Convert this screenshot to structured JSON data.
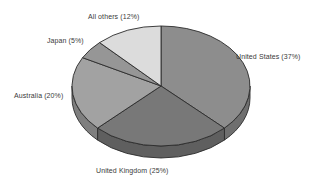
{
  "chart_data": {
    "type": "pie",
    "title": "",
    "subtitle": "",
    "xlabel": "",
    "ylabel": "",
    "legend_position": "none",
    "grid": false,
    "three_d": true,
    "start_angle_deg": 0,
    "direction": "clockwise",
    "categories": [
      "United States",
      "United Kingdom",
      "Australia",
      "Japan",
      "All others"
    ],
    "values": [
      37,
      25,
      20,
      5,
      12
    ],
    "unit": "%",
    "slices": [
      {
        "name": "United States",
        "value": 37,
        "label": "United States (37%)",
        "color": "#8d8d8d",
        "side_color": "#6f6f6f",
        "label_position": "right"
      },
      {
        "name": "United Kingdom",
        "value": 25,
        "label": "United Kingdom (25%)",
        "color": "#787878",
        "side_color": "#5f5f5f",
        "label_position": "bottom"
      },
      {
        "name": "Australia",
        "value": 20,
        "label": "Australia (20%)",
        "color": "#a2a2a2",
        "side_color": "#7f7f7f",
        "label_position": "left"
      },
      {
        "name": "Japan",
        "value": 5,
        "label": "Japan (5%)",
        "color": "#969696",
        "side_color": "#767676",
        "label_position": "upper-left"
      },
      {
        "name": "All others",
        "value": 12,
        "label": "All others (12%)",
        "color": "#dcdcdc",
        "side_color": "#b4b4b4",
        "label_position": "top"
      }
    ],
    "colors": {
      "background": "#ffffff",
      "outline": "#2b2b2b",
      "label_text": "#3a3a3a"
    },
    "geometry": {
      "center_x": 161,
      "center_y": 86,
      "radius_x": 89,
      "radius_y": 60,
      "depth": 12
    }
  }
}
